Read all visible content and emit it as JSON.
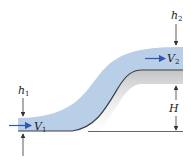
{
  "diagram": {
    "labels": {
      "h1": {
        "base": "h",
        "sub": "1"
      },
      "h2": {
        "base": "h",
        "sub": "2"
      },
      "V1": {
        "base": "V",
        "sub": "1"
      },
      "V2": {
        "base": "V",
        "sub": "2"
      },
      "H": {
        "base": "H",
        "sub": ""
      }
    },
    "colors": {
      "water": "#b9cfe8",
      "bed": "#3a3f4a",
      "arrow_flow": "#2f56b0",
      "dimension": "#333333",
      "shadow": "#d9d9d9"
    }
  }
}
